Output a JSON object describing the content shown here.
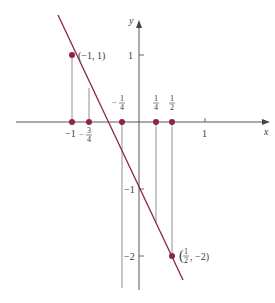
{
  "colors": {
    "line": "#8b2540",
    "point": "#8b2540",
    "axis": "#444444",
    "guide": "#777777",
    "text": "#3a3a3a"
  },
  "axes": {
    "x_label": "x",
    "y_label": "y",
    "x_ticks": [
      {
        "label": "-1",
        "value": -1
      },
      {
        "label": "-3/4",
        "value": -0.75
      },
      {
        "label": "-1/4",
        "value": -0.25
      },
      {
        "label": "1/4",
        "value": 0.25
      },
      {
        "label": "1/2",
        "value": 0.5
      },
      {
        "label": "1",
        "value": 1
      }
    ],
    "y_ticks": [
      {
        "label": "1",
        "value": 1
      },
      {
        "label": "-1",
        "value": -1
      },
      {
        "label": "-2",
        "value": -2
      }
    ]
  },
  "labels": {
    "x_axis": "x",
    "y_axis": "y",
    "x_neg1": "−1",
    "x_neg34_sign": "−",
    "x_neg34_num": "3",
    "x_neg34_den": "4",
    "x_neg14_sign": "−",
    "x_neg14_num": "1",
    "x_neg14_den": "4",
    "x_14_num": "1",
    "x_14_den": "4",
    "x_12_num": "1",
    "x_12_den": "2",
    "x_1": "1",
    "y_1": "1",
    "y_neg1": "−1",
    "y_neg2": "−2",
    "point_a": "(−1, 1)",
    "point_b_open": "(",
    "point_b_num": "1",
    "point_b_den": "2",
    "point_b_rest": ", −2)"
  },
  "line": {
    "equation": "y = -2x - 1",
    "slope": -2,
    "intercept": -1
  },
  "points": [
    {
      "x": -1,
      "y": 1,
      "label": "(−1, 1)"
    },
    {
      "x": 0.5,
      "y": -2,
      "label": "(1/2, −2)"
    }
  ],
  "x_axis_points": [
    -1,
    -0.75,
    -0.25,
    0.25,
    0.5
  ]
}
